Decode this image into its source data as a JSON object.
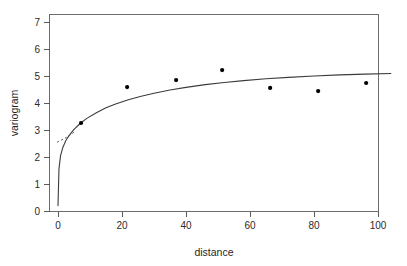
{
  "chart_data": {
    "type": "scatter",
    "title": "",
    "xlabel": "distance",
    "ylabel": "variogram",
    "xlim": [
      -4,
      104
    ],
    "ylim": [
      -0.2,
      7.3
    ],
    "xticks": [
      0,
      20,
      40,
      60,
      80,
      100
    ],
    "yticks": [
      0,
      1,
      2,
      3,
      4,
      5,
      6,
      7
    ],
    "grid": false,
    "legend": null,
    "series": [
      {
        "name": "empirical variogram",
        "type": "scatter",
        "marker": "filled-circle",
        "color": "#000000",
        "x": [
          7.2,
          21.6,
          36.9,
          51.3,
          66.3,
          81.3,
          96.3
        ],
        "y": [
          3.26,
          4.59,
          4.85,
          5.22,
          4.56,
          4.44,
          4.74
        ]
      },
      {
        "name": "fitted variogram model",
        "type": "line",
        "style": "solid",
        "color": "#3c3c3c",
        "x": [
          0.0,
          0.3,
          0.8,
          1.5,
          2.5,
          3.5,
          5.0,
          7.0,
          9.0,
          12.0,
          15.0,
          18.0,
          22.0,
          26.0,
          30.0,
          35.0,
          40.0,
          46.0,
          52.0,
          58.0,
          65.0,
          72.0,
          80.0,
          88.0,
          96.0,
          104.0
        ],
        "y": [
          0.2,
          1.55,
          2.05,
          2.35,
          2.62,
          2.8,
          3.02,
          3.25,
          3.43,
          3.64,
          3.82,
          3.96,
          4.12,
          4.25,
          4.36,
          4.48,
          4.58,
          4.68,
          4.76,
          4.83,
          4.9,
          4.95,
          5.0,
          5.04,
          5.07,
          5.09
        ]
      },
      {
        "name": "tangent reference",
        "type": "line",
        "style": "dashed",
        "color": "#555555",
        "x": [
          -0.3,
          2.0,
          4.0,
          5.6
        ],
        "y": [
          2.55,
          2.68,
          2.83,
          2.97
        ]
      }
    ]
  },
  "axes": {
    "x_title": "distance",
    "y_title": "variogram",
    "x_tick_labels": [
      "0",
      "20",
      "40",
      "60",
      "80",
      "100"
    ],
    "y_tick_labels": [
      "0",
      "1",
      "2",
      "3",
      "4",
      "5",
      "6",
      "7"
    ]
  },
  "style": {
    "background": "#ffffff",
    "frame_color": "#6b6b6b",
    "axis_color": "#5a5a5a",
    "curve_color": "#3c3c3c",
    "point_color": "#000000",
    "dashed_color": "#555555"
  }
}
